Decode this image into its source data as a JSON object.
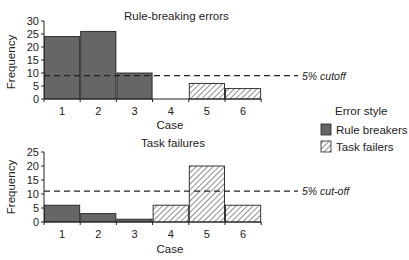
{
  "chart_data": [
    {
      "type": "bar",
      "title": "Rule-breaking errors",
      "xlabel": "Case",
      "ylabel": "Frequency",
      "categories": [
        "1",
        "2",
        "3",
        "4",
        "5",
        "6"
      ],
      "series": [
        {
          "name": "Rule breakers",
          "style": "solid-dark",
          "values": [
            24,
            26,
            10,
            0,
            0,
            0
          ]
        },
        {
          "name": "Task failers",
          "style": "hatched",
          "values": [
            0,
            0,
            0,
            0,
            6,
            4
          ]
        }
      ],
      "yticks": [
        0,
        5,
        10,
        15,
        20,
        25,
        30
      ],
      "ylim": [
        0,
        30
      ],
      "reference_line": {
        "value": 9,
        "label": "5% cutoff",
        "style": "dashed"
      },
      "grid": false
    },
    {
      "type": "bar",
      "title": "Task failures",
      "xlabel": "Case",
      "ylabel": "Frequency",
      "categories": [
        "1",
        "2",
        "3",
        "4",
        "5",
        "6"
      ],
      "series": [
        {
          "name": "Rule breakers",
          "style": "solid-dark",
          "values": [
            6,
            3,
            1,
            0,
            0,
            0
          ]
        },
        {
          "name": "Task failers",
          "style": "hatched",
          "values": [
            0,
            0,
            0,
            6,
            20,
            6
          ]
        }
      ],
      "yticks": [
        0,
        5,
        10,
        15,
        20,
        25
      ],
      "ylim": [
        0,
        25
      ],
      "reference_line": {
        "value": 11,
        "label": "5% cut-off",
        "style": "dashed"
      },
      "grid": false
    }
  ],
  "legend": {
    "title": "Error style",
    "position": "right",
    "items": [
      {
        "label": "Rule breakers",
        "style": "solid-dark",
        "color": "#666666"
      },
      {
        "label": "Task failers",
        "style": "hatched",
        "color": "#ffffff"
      }
    ]
  },
  "colors": {
    "solid_bar": "#666666",
    "bar_edge": "#222222",
    "hatch": "#333333"
  }
}
